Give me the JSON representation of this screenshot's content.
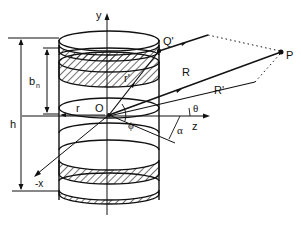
{
  "figure": {
    "labels": {
      "y_axis": "y",
      "z_axis": "z",
      "neg_x_axis": "-x",
      "origin": "O",
      "radius": "r",
      "height": "h",
      "ring_width": "b",
      "ring_width_subscript": "n",
      "point_q": "Q'",
      "point_p": "P",
      "distance_r": "R",
      "distance_r_prime": "R'",
      "vector_r_prime": "r'",
      "angle_theta": "θ",
      "angle_phi": "ϕ",
      "angle_alpha": "α"
    }
  }
}
